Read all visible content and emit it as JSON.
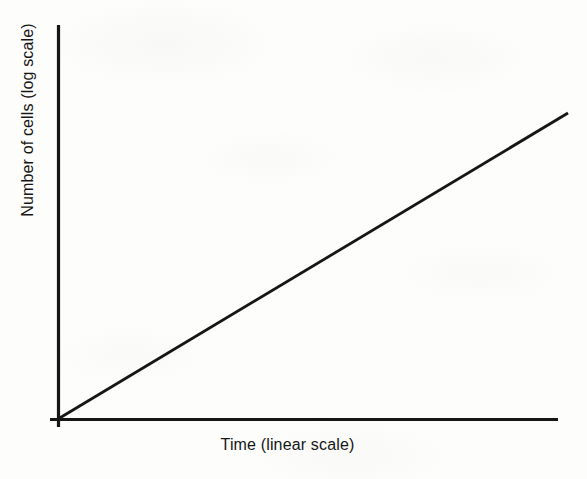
{
  "figure": {
    "background_color": "#fdfdfc",
    "ink_color": "#161616"
  },
  "axes": {
    "x_title": "Time (linear scale)",
    "y_title": "Number of cells (log scale)"
  },
  "chart_data": {
    "type": "line",
    "title": "",
    "subtitle": "",
    "xlabel": "Time (linear scale)",
    "ylabel": "Number of cells (log scale)",
    "x_scale": "linear",
    "y_scale": "log",
    "grid": false,
    "legend": false,
    "legend_position": "none",
    "xlim": [
      0,
      1
    ],
    "ylim": [
      0,
      1
    ],
    "x_tick_labels": [],
    "y_tick_labels": [],
    "annotations": [],
    "series": [
      {
        "name": "Exponential cell growth",
        "description": "Straight line on a semilog plot, rising from the origin",
        "x": [
          0,
          0.25,
          0.5,
          0.75,
          1
        ],
        "y": [
          0,
          0.25,
          0.5,
          0.75,
          1
        ]
      }
    ]
  },
  "geometry": {
    "y_axis": {
      "x": 58,
      "y_top": 25,
      "y_bottom": 427,
      "width": 3
    },
    "x_axis": {
      "y": 419.5,
      "x_left": 50,
      "x_right": 558,
      "width": 3
    },
    "data_line": {
      "x1": 58,
      "y1": 419,
      "x2": 568,
      "y2": 113,
      "width": 2.8
    }
  }
}
